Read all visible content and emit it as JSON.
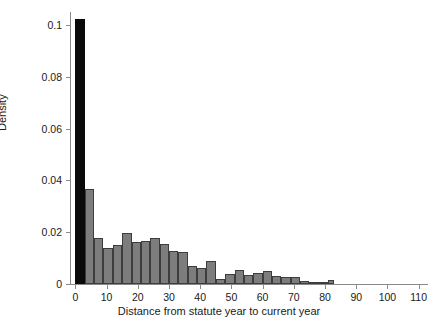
{
  "chart_data": {
    "type": "bar",
    "title": "",
    "subtitle": "",
    "xlabel": "Distance from statute year to current year",
    "ylabel": "Density",
    "xlim": [
      -3,
      113
    ],
    "ylim": [
      0,
      0.105
    ],
    "grid": false,
    "legend": null,
    "bin_width": 3,
    "x_ticks": [
      0,
      10,
      20,
      30,
      40,
      50,
      60,
      70,
      80,
      90,
      100,
      110
    ],
    "x_tick_labels": [
      "0",
      "10",
      "20",
      "30",
      "40",
      "50",
      "60",
      "70",
      "80",
      "90",
      "100",
      "110"
    ],
    "y_ticks": [
      0,
      0.02,
      0.04,
      0.06,
      0.08,
      0.1
    ],
    "y_tick_labels": [
      "0",
      "0.02",
      "0.04",
      "0.06",
      "0.08",
      "0.1"
    ],
    "highlight_color": "#0a0a0a",
    "bar_color": "#7d7d7d",
    "bar_edge_color": "#3d3d3d",
    "bins": [
      {
        "x0": 0,
        "x1": 3,
        "density": 0.1023,
        "highlighted": true
      },
      {
        "x0": 3,
        "x1": 6,
        "density": 0.0365,
        "highlighted": false
      },
      {
        "x0": 6,
        "x1": 9,
        "density": 0.0178,
        "highlighted": false
      },
      {
        "x0": 9,
        "x1": 12,
        "density": 0.014,
        "highlighted": false
      },
      {
        "x0": 12,
        "x1": 15,
        "density": 0.0151,
        "highlighted": false
      },
      {
        "x0": 15,
        "x1": 18,
        "density": 0.0197,
        "highlighted": false
      },
      {
        "x0": 18,
        "x1": 21,
        "density": 0.0163,
        "highlighted": false
      },
      {
        "x0": 21,
        "x1": 24,
        "density": 0.0167,
        "highlighted": false
      },
      {
        "x0": 24,
        "x1": 27,
        "density": 0.0178,
        "highlighted": false
      },
      {
        "x0": 27,
        "x1": 30,
        "density": 0.0155,
        "highlighted": false
      },
      {
        "x0": 30,
        "x1": 33,
        "density": 0.0129,
        "highlighted": false
      },
      {
        "x0": 33,
        "x1": 36,
        "density": 0.0125,
        "highlighted": false
      },
      {
        "x0": 36,
        "x1": 39,
        "density": 0.0068,
        "highlighted": false
      },
      {
        "x0": 39,
        "x1": 42,
        "density": 0.0061,
        "highlighted": false
      },
      {
        "x0": 42,
        "x1": 45,
        "density": 0.0087,
        "highlighted": false
      },
      {
        "x0": 45,
        "x1": 48,
        "density": 0.0019,
        "highlighted": false
      },
      {
        "x0": 48,
        "x1": 51,
        "density": 0.0038,
        "highlighted": false
      },
      {
        "x0": 51,
        "x1": 54,
        "density": 0.0053,
        "highlighted": false
      },
      {
        "x0": 54,
        "x1": 57,
        "density": 0.0034,
        "highlighted": false
      },
      {
        "x0": 57,
        "x1": 60,
        "density": 0.0042,
        "highlighted": false
      },
      {
        "x0": 60,
        "x1": 63,
        "density": 0.0049,
        "highlighted": false
      },
      {
        "x0": 63,
        "x1": 66,
        "density": 0.003,
        "highlighted": false
      },
      {
        "x0": 66,
        "x1": 69,
        "density": 0.0026,
        "highlighted": false
      },
      {
        "x0": 69,
        "x1": 72,
        "density": 0.0026,
        "highlighted": false
      },
      {
        "x0": 72,
        "x1": 75,
        "density": 0.0011,
        "highlighted": false
      },
      {
        "x0": 75,
        "x1": 78,
        "density": 0.0008,
        "highlighted": false
      },
      {
        "x0": 78,
        "x1": 81,
        "density": 0.0008,
        "highlighted": false
      },
      {
        "x0": 81,
        "x1": 83,
        "density": 0.0015,
        "highlighted": false
      }
    ]
  }
}
